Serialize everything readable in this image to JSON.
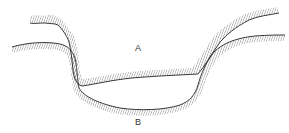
{
  "diagram": {
    "type": "cross-section profiles",
    "labels": {
      "a": "A",
      "b": "B"
    },
    "colors": {
      "line": "#222222",
      "hatch": "#8a8a8a",
      "label": "#333333",
      "background": "#ffffff"
    },
    "profiles": [
      {
        "name": "A",
        "description": "upper profile with hatched ground surface"
      },
      {
        "name": "B",
        "description": "lower profile with hatched ground surface"
      }
    ]
  }
}
